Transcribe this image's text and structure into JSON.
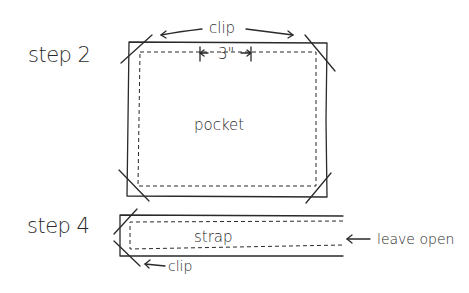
{
  "diagram": {
    "steps": [
      {
        "label": "step 2",
        "part": "pocket",
        "annotations": {
          "clip_top": "clip",
          "dimension": "3\""
        }
      },
      {
        "label": "step 4",
        "part": "strap",
        "annotations": {
          "leave_open": "leave open",
          "clip_bottom": "clip"
        }
      }
    ],
    "colors": {
      "ink": "#2a2a2a",
      "background": "#ffffff"
    }
  }
}
